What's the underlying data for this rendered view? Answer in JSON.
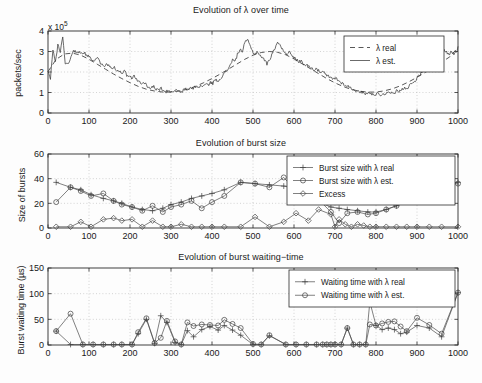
{
  "figure": {
    "width": 482,
    "height": 383,
    "background": "#fdfdfd",
    "line_color": "#3a3a3a",
    "grid_color": "#b8b8b8",
    "axis_color": "#2b2b2b"
  },
  "panels": [
    {
      "key": "lambda",
      "title": "Evolution of λ over time",
      "ylabel": "packets/sec",
      "exponent_prefix": "x 10",
      "exponent_power": "5"
    },
    {
      "key": "burst_size",
      "title": "Evolution of burst size",
      "ylabel": "Size of bursts"
    },
    {
      "key": "waiting_time",
      "title": "Evolution of burst waiting−time",
      "ylabel": "Burst waiting time (µs)"
    }
  ],
  "chart_data": [
    {
      "type": "line",
      "title": "Evolution of λ over time",
      "xlabel": "",
      "ylabel": "packets/sec",
      "y_exponent": 100000,
      "y_exponent_label": "x 10^5",
      "xlim": [
        0,
        1000
      ],
      "ylim": [
        0,
        4
      ],
      "xticks": [
        0,
        100,
        200,
        300,
        400,
        500,
        600,
        700,
        800,
        900,
        1000
      ],
      "yticks": [
        0,
        1,
        2,
        3,
        4
      ],
      "grid": true,
      "legend_position": "top-right",
      "series": [
        {
          "name": "λ real",
          "style": "dashed",
          "x": [
            0,
            20,
            40,
            60,
            80,
            100,
            120,
            140,
            160,
            180,
            200,
            220,
            240,
            260,
            280,
            300,
            320,
            340,
            360,
            380,
            400,
            420,
            440,
            460,
            480,
            500,
            520,
            540,
            560,
            580,
            600,
            620,
            640,
            660,
            680,
            700,
            720,
            740,
            760,
            780,
            800,
            820,
            840,
            860,
            880,
            900,
            920,
            940,
            960,
            980,
            1000
          ],
          "values": [
            2.02,
            2.62,
            2.88,
            2.92,
            2.82,
            2.62,
            2.38,
            2.14,
            1.9,
            1.68,
            1.48,
            1.3,
            1.16,
            1.07,
            1.02,
            1.02,
            1.07,
            1.16,
            1.3,
            1.48,
            1.68,
            1.9,
            2.14,
            2.38,
            2.62,
            2.82,
            2.95,
            3.0,
            2.96,
            2.84,
            2.64,
            2.4,
            2.16,
            1.92,
            1.68,
            1.47,
            1.29,
            1.15,
            1.06,
            1.02,
            1.02,
            1.08,
            1.18,
            1.33,
            1.52,
            1.74,
            1.98,
            2.22,
            2.48,
            2.74,
            3.2
          ]
        },
        {
          "name": "λ est.",
          "style": "solid",
          "x": [
            0,
            6,
            12,
            18,
            24,
            30,
            36,
            42,
            48,
            54,
            60,
            66,
            72,
            78,
            84,
            90,
            96,
            102,
            108,
            114,
            120,
            126,
            132,
            138,
            144,
            150,
            156,
            162,
            168,
            174,
            180,
            186,
            192,
            198,
            204,
            210,
            216,
            222,
            228,
            234,
            240,
            246,
            252,
            258,
            264,
            270,
            276,
            282,
            288,
            294,
            300,
            306,
            312,
            318,
            324,
            330,
            336,
            342,
            348,
            354,
            360,
            366,
            372,
            378,
            384,
            390,
            396,
            402,
            408,
            414,
            420,
            426,
            432,
            438,
            444,
            450,
            456,
            462,
            468,
            474,
            480,
            486,
            492,
            498,
            504,
            510,
            516,
            522,
            528,
            534,
            540,
            546,
            552,
            558,
            564,
            570,
            576,
            582,
            588,
            594,
            600,
            606,
            612,
            618,
            624,
            630,
            636,
            642,
            648,
            654,
            660,
            666,
            672,
            678,
            684,
            690,
            696,
            702,
            708,
            714,
            720,
            726,
            732,
            738,
            744,
            750,
            756,
            762,
            768,
            774,
            780,
            786,
            792,
            798,
            804,
            810,
            816,
            822,
            828,
            834,
            840,
            846,
            852,
            858,
            864,
            870,
            876,
            882,
            888,
            894,
            900,
            906,
            912,
            918,
            924,
            930,
            936,
            942,
            948,
            954,
            960,
            966,
            972,
            978,
            984,
            990,
            1000
          ],
          "values": [
            2.0,
            1.7,
            3.05,
            2.55,
            3.3,
            2.95,
            3.7,
            2.45,
            2.35,
            2.6,
            3.0,
            3.05,
            2.9,
            3.0,
            2.85,
            2.9,
            2.75,
            2.78,
            2.62,
            2.55,
            2.7,
            2.5,
            2.38,
            2.3,
            2.4,
            2.25,
            2.12,
            2.2,
            2.05,
            2.0,
            1.95,
            2.05,
            1.85,
            1.78,
            1.72,
            1.8,
            1.65,
            1.55,
            1.45,
            1.5,
            1.35,
            1.28,
            1.22,
            1.3,
            1.15,
            1.1,
            1.2,
            1.05,
            1.02,
            1.12,
            1.0,
            1.06,
            1.15,
            1.05,
            1.0,
            1.1,
            1.18,
            1.12,
            1.25,
            1.2,
            1.3,
            1.22,
            1.35,
            1.28,
            1.42,
            1.35,
            1.5,
            1.45,
            1.62,
            1.55,
            1.7,
            1.82,
            1.95,
            2.1,
            2.35,
            2.6,
            2.5,
            2.85,
            3.1,
            3.0,
            3.4,
            3.6,
            3.3,
            3.05,
            2.85,
            3.0,
            2.85,
            2.7,
            2.6,
            2.4,
            2.55,
            2.9,
            3.1,
            3.35,
            3.45,
            3.15,
            3.0,
            2.9,
            3.0,
            2.8,
            2.7,
            2.6,
            2.5,
            2.55,
            2.4,
            2.3,
            2.35,
            2.2,
            2.1,
            2.2,
            2.05,
            1.95,
            2.0,
            1.85,
            1.78,
            1.7,
            1.65,
            1.72,
            1.58,
            1.5,
            1.42,
            1.35,
            1.3,
            1.22,
            1.15,
            1.1,
            1.05,
            0.98,
            1.05,
            0.95,
            1.0,
            0.92,
            0.95,
            0.9,
            0.95,
            0.88,
            0.92,
            0.95,
            1.0,
            0.95,
            1.05,
            1.0,
            1.1,
            1.05,
            1.18,
            1.25,
            1.2,
            1.35,
            1.45,
            1.55,
            1.7,
            1.85,
            2.0,
            2.2,
            2.45,
            2.7,
            2.9,
            3.05,
            2.9,
            3.05,
            2.95,
            3.1,
            2.95,
            2.85,
            3.0,
            2.9,
            3.1,
            3.25
          ]
        }
      ]
    },
    {
      "type": "line",
      "title": "Evolution of burst size",
      "xlabel": "",
      "ylabel": "Size of bursts",
      "xlim": [
        0,
        1000
      ],
      "ylim": [
        0,
        60
      ],
      "xticks": [
        0,
        100,
        200,
        300,
        400,
        500,
        600,
        700,
        800,
        900,
        1000
      ],
      "yticks": [
        0,
        20,
        40,
        60
      ],
      "grid": true,
      "legend_position": "top-right",
      "series": [
        {
          "name": "Burst size with λ real",
          "marker": "plus",
          "x": [
            20,
            55,
            80,
            105,
            135,
            160,
            180,
            205,
            230,
            255,
            280,
            300,
            325,
            350,
            375,
            400,
            430,
            470,
            505,
            540,
            575,
            605,
            635,
            660,
            690,
            710,
            730,
            755,
            780,
            800,
            825,
            850,
            875,
            900,
            930,
            960,
            1000
          ],
          "values": [
            37,
            33,
            31,
            27,
            24,
            22,
            20,
            17,
            15,
            14,
            16,
            19,
            21,
            24,
            26,
            28,
            31,
            37,
            36,
            35,
            34,
            32,
            26,
            21,
            17,
            16,
            15,
            14,
            13,
            13,
            15,
            18,
            22,
            26,
            31,
            35,
            37
          ]
        },
        {
          "name": "Burst size with λ est.",
          "marker": "circle",
          "x": [
            20,
            55,
            80,
            105,
            135,
            160,
            180,
            205,
            230,
            255,
            280,
            300,
            325,
            350,
            375,
            400,
            430,
            470,
            505,
            540,
            575,
            605,
            635,
            660,
            690,
            710,
            730,
            755,
            780,
            800,
            825,
            850,
            875,
            900,
            930,
            960,
            1000
          ],
          "values": [
            21,
            33,
            30,
            26,
            28,
            22,
            19,
            17,
            14,
            18,
            13,
            17,
            19,
            22,
            16,
            21,
            26,
            37,
            36,
            33,
            41,
            30,
            29,
            23,
            13,
            4,
            12,
            13,
            11,
            12,
            15,
            18,
            22,
            26,
            30,
            35,
            36
          ]
        },
        {
          "name": "Excess",
          "marker": "diamond",
          "x": [
            20,
            55,
            80,
            105,
            135,
            160,
            180,
            205,
            230,
            255,
            280,
            300,
            325,
            350,
            375,
            400,
            430,
            470,
            505,
            540,
            575,
            605,
            635,
            660,
            690,
            700,
            710,
            725,
            740,
            755,
            770,
            785,
            800,
            825,
            850,
            875,
            900,
            930,
            960,
            1000
          ],
          "values": [
            1,
            1,
            5,
            1,
            7,
            8,
            6,
            7,
            1,
            6,
            1,
            1,
            3,
            1,
            1,
            1,
            1,
            1,
            9,
            1,
            5,
            12,
            6,
            15,
            11,
            1,
            7,
            3,
            1,
            3,
            2,
            1,
            1,
            1,
            1,
            1,
            1,
            1,
            1,
            1
          ]
        }
      ]
    },
    {
      "type": "line",
      "title": "Evolution of burst waiting−time",
      "xlabel": "",
      "ylabel": "Burst waiting time (µs)",
      "xlim": [
        0,
        1000
      ],
      "ylim": [
        0,
        150
      ],
      "xticks": [
        0,
        100,
        200,
        300,
        400,
        500,
        600,
        700,
        800,
        900,
        1000
      ],
      "yticks": [
        0,
        50,
        100,
        150
      ],
      "grid": true,
      "legend_position": "top-right",
      "series": [
        {
          "name": "Waiting time with λ real",
          "marker": "plus",
          "x": [
            20,
            55,
            85,
            110,
            135,
            160,
            180,
            205,
            220,
            240,
            260,
            275,
            290,
            310,
            325,
            340,
            355,
            375,
            395,
            415,
            430,
            450,
            470,
            500,
            520,
            540,
            580,
            605,
            630,
            655,
            670,
            680,
            690,
            700,
            715,
            730,
            745,
            760,
            775,
            785,
            800,
            815,
            830,
            845,
            860,
            875,
            900,
            930,
            960,
            1000
          ],
          "values": [
            27,
            1,
            1,
            1,
            1,
            1,
            1,
            1,
            22,
            50,
            3,
            57,
            44,
            5,
            1,
            28,
            16,
            30,
            36,
            29,
            38,
            29,
            19,
            1,
            1,
            18,
            1,
            1,
            1,
            1,
            1,
            1,
            1,
            1,
            1,
            33,
            1,
            1,
            1,
            84,
            38,
            30,
            33,
            30,
            22,
            25,
            38,
            33,
            16,
            102
          ]
        },
        {
          "name": "Waiting time with λ est.",
          "marker": "circle",
          "x": [
            20,
            55,
            85,
            110,
            135,
            160,
            180,
            205,
            220,
            240,
            260,
            275,
            290,
            310,
            325,
            340,
            355,
            375,
            395,
            415,
            430,
            450,
            470,
            500,
            520,
            540,
            580,
            605,
            630,
            655,
            670,
            680,
            690,
            700,
            715,
            730,
            745,
            760,
            775,
            785,
            800,
            815,
            830,
            845,
            860,
            875,
            900,
            930,
            960,
            1000
          ],
          "values": [
            27,
            61,
            1,
            1,
            1,
            1,
            1,
            1,
            25,
            52,
            4,
            14,
            47,
            7,
            1,
            44,
            37,
            40,
            39,
            38,
            49,
            41,
            33,
            2,
            1,
            19,
            1,
            1,
            1,
            1,
            1,
            1,
            1,
            1,
            1,
            33,
            1,
            1,
            1,
            40,
            38,
            42,
            45,
            46,
            36,
            27,
            53,
            39,
            22,
            102
          ]
        }
      ]
    }
  ]
}
